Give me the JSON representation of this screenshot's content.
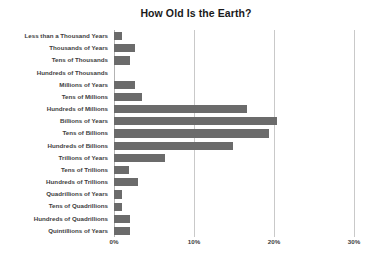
{
  "chart_data": {
    "type": "bar",
    "orientation": "horizontal",
    "title": "How Old Is the Earth?",
    "xlabel": "",
    "ylabel": "",
    "xlim": [
      0,
      30
    ],
    "xticks": [
      0,
      10,
      20,
      30
    ],
    "xtick_labels": [
      "0%",
      "10%",
      "20%",
      "30%"
    ],
    "grid": "vertical",
    "legend": "none",
    "value_unit": "%",
    "bar_color": "#6b6b6b",
    "categories": [
      "Less than a Thousand Years",
      "Thousands of Years",
      "Tens of Thousands",
      "Hundreds of Thousands",
      "Millions of Years",
      "Tens of Millions",
      "Hundreds of Millions",
      "Billions of Years",
      "Tens of Billions",
      "Hundreds of Billions",
      "Trillions of Years",
      "Tens of Trillions",
      "Hundreds of Trillions",
      "Quadrillions of Years",
      "Tens of Quadrillions",
      "Hundreds of Quadrillions",
      "Quintillions of Years"
    ],
    "values": [
      1.0,
      2.6,
      2.0,
      0.0,
      2.6,
      3.5,
      16.6,
      20.4,
      19.4,
      14.9,
      6.4,
      1.9,
      3.0,
      1.0,
      1.0,
      2.0,
      2.0
    ]
  }
}
